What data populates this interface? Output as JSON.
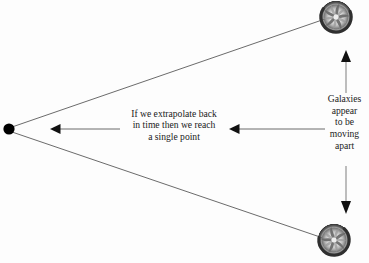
{
  "diagram": {
    "background_color": "#fdfdfd",
    "line_color": "#555555",
    "ink_color": "#1a1a1a"
  },
  "origin_point": {
    "label": "single-point-origin",
    "x": 9,
    "y": 129,
    "radius": 5.5,
    "color": "#000000"
  },
  "galaxies": [
    {
      "name": "top-galaxy",
      "cx": 336,
      "cy": 17,
      "r": 17,
      "arms": 5
    },
    {
      "name": "bottom-galaxy",
      "cx": 334,
      "cy": 240,
      "r": 17,
      "arms": 5
    }
  ],
  "sight_lines": [
    {
      "name": "upper-sight-line",
      "x1": 12,
      "y1": 127,
      "x2": 324,
      "y2": 20
    },
    {
      "name": "lower-sight-line",
      "x1": 12,
      "y1": 132,
      "x2": 322,
      "y2": 237
    }
  ],
  "extrapolate_annotation": {
    "name": "extrapolate-text",
    "lines": [
      "If we extrapolate back",
      "in time then we reach",
      "a single point"
    ]
  },
  "galaxies_annotation": {
    "name": "galaxies-text",
    "lines": [
      "Galaxies",
      "appear",
      "to be",
      "moving",
      "apart"
    ]
  },
  "arrows": {
    "left_horizontal": {
      "name": "left-arrow",
      "direction": "left",
      "tip_x": 51,
      "tail_x": 120,
      "y": 129
    },
    "middle_horizontal": {
      "name": "middle-arrow",
      "direction": "left",
      "tip_x": 230,
      "tail_x": 325,
      "y": 129
    },
    "up_vertical": {
      "name": "up-arrow",
      "direction": "up",
      "x": 346,
      "tip_y": 51,
      "tail_y": 92
    },
    "down_vertical": {
      "name": "down-arrow",
      "direction": "down",
      "x": 346,
      "tip_y": 213,
      "tail_y": 166
    }
  }
}
